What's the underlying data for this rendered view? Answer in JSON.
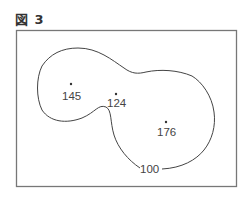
{
  "figure": {
    "title": "図 3",
    "contour_label": "100",
    "points": [
      {
        "label": "145",
        "x": 71,
        "y": 84
      },
      {
        "label": "124",
        "x": 116,
        "y": 94
      },
      {
        "label": "176",
        "x": 166,
        "y": 122
      }
    ],
    "colors": {
      "frame": "#777777",
      "contour": "#444444",
      "text": "#444444"
    }
  }
}
